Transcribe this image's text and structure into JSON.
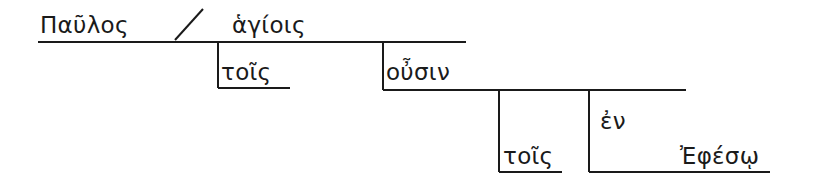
{
  "diagram": {
    "type": "sentence-diagram",
    "language": "Greek",
    "words": {
      "subject": "Παῦλος",
      "appositive": "ἁγίοις",
      "article_1": "τοῖς",
      "participle": "οὖσιν",
      "article_2": "τοῖς",
      "preposition": "ἐν",
      "object_of_preposition": "Ἐφέσῳ"
    },
    "colors": {
      "line": "#1a1a1a",
      "text": "#1a1a1a",
      "background": "#ffffff"
    }
  }
}
